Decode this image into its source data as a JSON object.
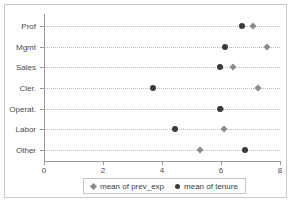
{
  "chart_data": {
    "type": "scatter",
    "title": "",
    "subtitle": "",
    "xlabel": "",
    "ylabel": "",
    "orientation": "horizontal",
    "categories": [
      "Prof",
      "Mgmt",
      "Sales",
      "Cler.",
      "Operat.",
      "Labor",
      "Other"
    ],
    "xlim": [
      0,
      8
    ],
    "xticks": [
      0,
      2,
      4,
      6,
      8
    ],
    "xticklabels": [
      "0",
      "2",
      "4",
      "6",
      "8"
    ],
    "grid": "horizontal-dotted",
    "legend_position": "bottom",
    "series": [
      {
        "name": "mean of prev_exp",
        "marker": "diamond",
        "color": "#8b8b8b",
        "values": [
          7.1,
          7.55,
          6.4,
          7.25,
          6.0,
          6.1,
          5.3
        ]
      },
      {
        "name": "mean of tenure",
        "marker": "circle",
        "color": "#3b3b3b",
        "values": [
          6.7,
          6.15,
          5.95,
          3.7,
          5.95,
          4.45,
          6.8
        ]
      }
    ]
  },
  "axes": {
    "y_labels": [
      "Prof",
      "Mgmt",
      "Sales",
      "Cler.",
      "Operat.",
      "Labor",
      "Other"
    ],
    "x_labels": [
      "0",
      "2",
      "4",
      "6",
      "8"
    ]
  },
  "legend": {
    "entries": [
      {
        "label": "mean of prev_exp",
        "marker": "diamond-marker-icon"
      },
      {
        "label": "mean of tenure",
        "marker": "circle-marker-icon"
      }
    ]
  },
  "colors": {
    "prev_exp": "#8b8b8b",
    "tenure": "#3b3b3b",
    "axis": "#9a9a9a",
    "grid": "#b9b9b9",
    "frame": "#c8c8c8"
  }
}
